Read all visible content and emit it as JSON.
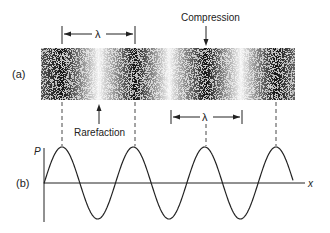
{
  "figure": {
    "panel_a_label": "(a)",
    "panel_b_label": "(b)",
    "compression_label": "Compression",
    "rarefaction_label": "Rarefaction",
    "wavelength_symbol": "λ",
    "y_axis_label": "P",
    "x_axis_label": "x"
  },
  "band": {
    "x_start": 41,
    "x_end": 295,
    "y_top": 48,
    "y_bottom": 100,
    "compression_centers": [
      62,
      135,
      206,
      276
    ],
    "dark_color": "#111111",
    "light_color": "#ffffff"
  },
  "wave": {
    "axis_y": 183,
    "amplitude": 36,
    "x_start": 44,
    "x_end": 293,
    "peaks_x": [
      62,
      135,
      206,
      276
    ],
    "color": "#222222"
  }
}
